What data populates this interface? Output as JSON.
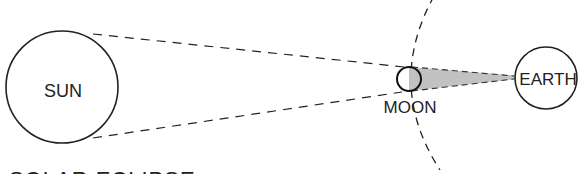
{
  "diagram": {
    "caption": "SOLAR ECLIPSE",
    "bodies": {
      "sun": {
        "label": "SUN"
      },
      "moon": {
        "label": "MOON"
      },
      "earth": {
        "label": "EARTH"
      }
    },
    "colors": {
      "stroke": "#222222",
      "shadow": "#8a8a8a",
      "background": "#ffffff"
    }
  }
}
